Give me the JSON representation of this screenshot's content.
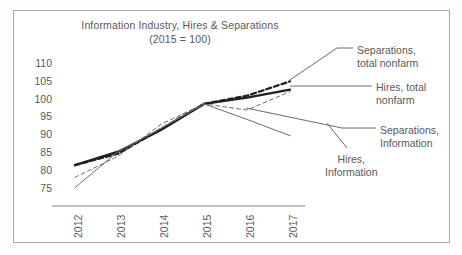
{
  "chart_data": {
    "type": "line",
    "title": "Information Industry, Hires & Separations",
    "subtitle": "(2015 = 100)",
    "xlabel": "",
    "ylabel": "",
    "ylim": [
      75,
      110
    ],
    "yticks": [
      75,
      80,
      85,
      90,
      95,
      100,
      105,
      110
    ],
    "grid": false,
    "legend_position": "annotations-right",
    "categories": [
      "2012",
      "2013",
      "2014",
      "2015",
      "2016",
      "2017"
    ],
    "x": [
      2012,
      2013,
      2014,
      2015,
      2016,
      2017
    ],
    "series": [
      {
        "name": "Hires, total nonfarm",
        "style": "thick-solid",
        "color": "#231f20",
        "values": [
          85.0,
          88.3,
          93.6,
          100.0,
          101.5,
          103.5
        ]
      },
      {
        "name": "Separations, total nonfarm",
        "style": "thick-dashed",
        "color": "#231f20",
        "values": [
          85.0,
          87.8,
          93.9,
          100.0,
          102.0,
          105.5
        ]
      },
      {
        "name": "Hires, Information",
        "style": "thin-solid",
        "color": "#6d6e71",
        "values": [
          79.5,
          88.3,
          94.0,
          100.0,
          96.2,
          92.2
        ]
      },
      {
        "name": "Separations, Information",
        "style": "thin-dashed",
        "color": "#6d6e71",
        "values": [
          82.0,
          87.2,
          95.0,
          100.0,
          98.5,
          103.0
        ]
      }
    ],
    "annotations": [
      {
        "label_line1": "Separations,",
        "label_line2": "total nonfarm"
      },
      {
        "label_line1": "Hires, total",
        "label_line2": "nonfarm"
      },
      {
        "label_line1": "Separations,",
        "label_line2": "Information"
      },
      {
        "label_line1": "Hires,",
        "label_line2": "Information"
      }
    ]
  },
  "colors": {
    "frame": "#a7a9ac",
    "text": "#58595b",
    "dark_series": "#231f20",
    "light_series": "#6d6e71",
    "background": "#ffffff"
  }
}
